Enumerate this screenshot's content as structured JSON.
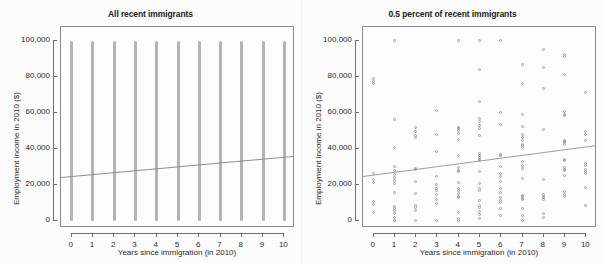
{
  "figure": {
    "background_color": "#fbfbfb",
    "panel_background": "#fcfcfc",
    "point_color": "#9a9aa2",
    "stripe_color": "#b4b4b4",
    "line_color": "#8d8d8d",
    "axis_color": "#6f6f6f"
  },
  "chart_data": [
    {
      "type": "scatter",
      "title": "All recent immigrants",
      "xlabel": "Years since immigration (in 2010)",
      "ylabel": "Employment income in 2010 ($)",
      "xlim": [
        -0.5,
        10.5
      ],
      "ylim": [
        -4000,
        108000
      ],
      "grid": false,
      "legend": null,
      "xticks": [
        0,
        1,
        2,
        3,
        4,
        5,
        6,
        7,
        8,
        9,
        10
      ],
      "xticklabels": [
        "0",
        "1",
        "2",
        "3",
        "4",
        "5",
        "6",
        "7",
        "8",
        "9",
        "10"
      ],
      "yticks": [
        0,
        20000,
        40000,
        60000,
        80000,
        100000
      ],
      "yticklabels": [
        "0",
        "20,000",
        "40,000",
        "60,000",
        "80,000",
        "100,000"
      ],
      "note": "Dense overplotted points form solid vertical bands at each integer x from y=0 to y=100,000 (top-coded).",
      "bands": [
        {
          "x": 0,
          "ymin": 0,
          "ymax": 100000
        },
        {
          "x": 1,
          "ymin": 0,
          "ymax": 100000
        },
        {
          "x": 2,
          "ymin": 0,
          "ymax": 100000
        },
        {
          "x": 3,
          "ymin": 0,
          "ymax": 100000
        },
        {
          "x": 4,
          "ymin": 0,
          "ymax": 100000
        },
        {
          "x": 5,
          "ymin": 0,
          "ymax": 100000
        },
        {
          "x": 6,
          "ymin": 0,
          "ymax": 100000
        },
        {
          "x": 7,
          "ymin": 0,
          "ymax": 100000
        },
        {
          "x": 8,
          "ymin": 0,
          "ymax": 100000
        },
        {
          "x": 9,
          "ymin": 0,
          "ymax": 100000
        },
        {
          "x": 10,
          "ymin": 0,
          "ymax": 100000
        }
      ],
      "fit_line": {
        "x0": -0.5,
        "y0": 24600,
        "x1": 10.5,
        "y1": 36400,
        "intercept": 25100,
        "slope": 1073
      }
    },
    {
      "type": "scatter",
      "title": "0.5 percent of recent immigrants",
      "xlabel": "Years since immigration (in 2010)",
      "ylabel": "Employment income in 2010 ($)",
      "xlim": [
        -0.5,
        10.5
      ],
      "ylim": [
        -4000,
        108000
      ],
      "grid": false,
      "legend": null,
      "xticks": [
        0,
        1,
        2,
        3,
        4,
        5,
        6,
        7,
        8,
        9,
        10
      ],
      "xticklabels": [
        "0",
        "1",
        "2",
        "3",
        "4",
        "5",
        "6",
        "7",
        "8",
        "9",
        "10"
      ],
      "yticks": [
        0,
        20000,
        40000,
        60000,
        80000,
        100000
      ],
      "yticklabels": [
        "0",
        "20,000",
        "40,000",
        "60,000",
        "80,000",
        "100,000"
      ],
      "marker": "open-circle",
      "points": [
        [
          0,
          79000
        ],
        [
          0,
          77500
        ],
        [
          0,
          76500
        ],
        [
          0,
          26000
        ],
        [
          0,
          22500
        ],
        [
          0,
          21000
        ],
        [
          0,
          10500
        ],
        [
          0,
          9000
        ],
        [
          0,
          4500
        ],
        [
          1,
          100000
        ],
        [
          1,
          56000
        ],
        [
          1,
          40500
        ],
        [
          1,
          30000
        ],
        [
          1,
          27500
        ],
        [
          1,
          25500
        ],
        [
          1,
          24000
        ],
        [
          1,
          22000
        ],
        [
          1,
          20500
        ],
        [
          1,
          15500
        ],
        [
          1,
          7500
        ],
        [
          1,
          6500
        ],
        [
          1,
          5500
        ],
        [
          1,
          4000
        ],
        [
          1,
          1500
        ],
        [
          1,
          0
        ],
        [
          1,
          0
        ],
        [
          2,
          51500
        ],
        [
          2,
          49500
        ],
        [
          2,
          47000
        ],
        [
          2,
          46000
        ],
        [
          2,
          29000
        ],
        [
          2,
          28500
        ],
        [
          2,
          21500
        ],
        [
          2,
          15000
        ],
        [
          2,
          8000
        ],
        [
          2,
          7000
        ],
        [
          2,
          5500
        ],
        [
          2,
          0
        ],
        [
          3,
          61000
        ],
        [
          3,
          48000
        ],
        [
          3,
          38500
        ],
        [
          3,
          24500
        ],
        [
          3,
          20000
        ],
        [
          3,
          18000
        ],
        [
          3,
          16500
        ],
        [
          3,
          14500
        ],
        [
          3,
          11500
        ],
        [
          3,
          9500
        ],
        [
          3,
          0
        ],
        [
          4,
          100000
        ],
        [
          4,
          52000
        ],
        [
          4,
          51000
        ],
        [
          4,
          50000
        ],
        [
          4,
          48500
        ],
        [
          4,
          45000
        ],
        [
          4,
          36000
        ],
        [
          4,
          29500
        ],
        [
          4,
          28000
        ],
        [
          4,
          27000
        ],
        [
          4,
          21000
        ],
        [
          4,
          18000
        ],
        [
          4,
          16500
        ],
        [
          4,
          15000
        ],
        [
          4,
          13500
        ],
        [
          4,
          12500
        ],
        [
          4,
          4500
        ],
        [
          4,
          1000
        ],
        [
          4,
          0
        ],
        [
          5,
          100000
        ],
        [
          5,
          84000
        ],
        [
          5,
          66000
        ],
        [
          5,
          57000
        ],
        [
          5,
          55000
        ],
        [
          5,
          53000
        ],
        [
          5,
          51000
        ],
        [
          5,
          47000
        ],
        [
          5,
          37000
        ],
        [
          5,
          36000
        ],
        [
          5,
          35000
        ],
        [
          5,
          34000
        ],
        [
          5,
          33500
        ],
        [
          5,
          27000
        ],
        [
          5,
          20500
        ],
        [
          5,
          18000
        ],
        [
          5,
          16500
        ],
        [
          5,
          11000
        ],
        [
          5,
          8500
        ],
        [
          5,
          7000
        ],
        [
          5,
          5000
        ],
        [
          5,
          3500
        ],
        [
          5,
          1000
        ],
        [
          6,
          100000
        ],
        [
          6,
          60000
        ],
        [
          6,
          53500
        ],
        [
          6,
          36500
        ],
        [
          6,
          36000
        ],
        [
          6,
          30000
        ],
        [
          6,
          26000
        ],
        [
          6,
          24500
        ],
        [
          6,
          21500
        ],
        [
          6,
          17500
        ],
        [
          6,
          15500
        ],
        [
          6,
          12500
        ],
        [
          6,
          11000
        ],
        [
          6,
          10000
        ],
        [
          6,
          6500
        ],
        [
          6,
          2500
        ],
        [
          7,
          87000
        ],
        [
          7,
          76500
        ],
        [
          7,
          59000
        ],
        [
          7,
          52500
        ],
        [
          7,
          48000
        ],
        [
          7,
          46000
        ],
        [
          7,
          44500
        ],
        [
          7,
          42000
        ],
        [
          7,
          41500
        ],
        [
          7,
          40500
        ],
        [
          7,
          32500
        ],
        [
          7,
          30500
        ],
        [
          7,
          29000
        ],
        [
          7,
          23500
        ],
        [
          7,
          14000
        ],
        [
          7,
          13000
        ],
        [
          7,
          12000
        ],
        [
          7,
          11500
        ],
        [
          7,
          6500
        ],
        [
          7,
          2500
        ],
        [
          7,
          0
        ],
        [
          7,
          0
        ],
        [
          8,
          95000
        ],
        [
          8,
          85000
        ],
        [
          8,
          73500
        ],
        [
          8,
          50500
        ],
        [
          8,
          22500
        ],
        [
          8,
          14500
        ],
        [
          8,
          13500
        ],
        [
          8,
          12500
        ],
        [
          8,
          11500
        ],
        [
          8,
          4000
        ],
        [
          8,
          1500
        ],
        [
          9,
          92500
        ],
        [
          9,
          91500
        ],
        [
          9,
          81500
        ],
        [
          9,
          60500
        ],
        [
          9,
          59000
        ],
        [
          9,
          58500
        ],
        [
          9,
          44500
        ],
        [
          9,
          44000
        ],
        [
          9,
          43500
        ],
        [
          9,
          42500
        ],
        [
          9,
          34000
        ],
        [
          9,
          33500
        ],
        [
          9,
          29500
        ],
        [
          9,
          28500
        ],
        [
          9,
          28000
        ],
        [
          9,
          25000
        ],
        [
          9,
          16000
        ],
        [
          9,
          14500
        ],
        [
          9,
          13500
        ],
        [
          10,
          71000
        ],
        [
          10,
          49500
        ],
        [
          10,
          48000
        ],
        [
          10,
          44500
        ],
        [
          10,
          31500
        ],
        [
          10,
          30500
        ],
        [
          10,
          28500
        ],
        [
          10,
          27000
        ],
        [
          10,
          26000
        ],
        [
          10,
          18500
        ],
        [
          10,
          8500
        ]
      ],
      "fit_line": {
        "x0": -0.5,
        "y0": 25200,
        "x1": 10.5,
        "y1": 42500,
        "intercept": 25900,
        "slope": 1570
      }
    }
  ]
}
